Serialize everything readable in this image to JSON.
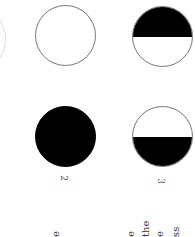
{
  "page": {
    "orientation": "rotated-90",
    "figures": [
      {
        "id": "circle-outline",
        "style": "empty"
      },
      {
        "id": "circle-top-half",
        "style": "top-half-filled"
      },
      {
        "id": "circle-filled",
        "style": "filled",
        "label": "2"
      },
      {
        "id": "circle-bottom-half",
        "style": "bottom-half-filled",
        "label": "3"
      }
    ],
    "text_fragments": [
      "e",
      "e",
      "the",
      "e",
      "ss"
    ]
  }
}
